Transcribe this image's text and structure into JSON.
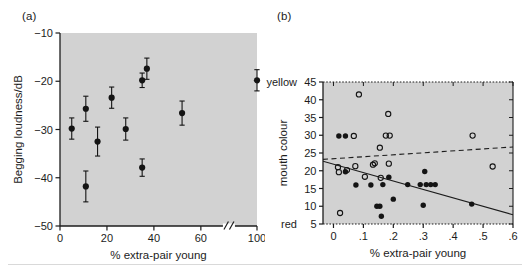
{
  "figure": {
    "background": "#ffffff",
    "plot_background": "#d2d2d2",
    "marker_color": "#141414",
    "panels": [
      "a",
      "b"
    ]
  },
  "panel_a": {
    "label": "(a)",
    "chart_data": {
      "type": "scatter",
      "title": "",
      "xlabel": "% extra-pair young",
      "ylabel": "Begging loudness/dB",
      "xlim": [
        0,
        100
      ],
      "ylim": [
        -50,
        -10
      ],
      "xticks": [
        0,
        20,
        40,
        60,
        100
      ],
      "xticklabels": [
        "0",
        "20",
        "40",
        "60",
        "100"
      ],
      "yticks": [
        -10,
        -20,
        -30,
        -40,
        -50
      ],
      "yticklabels": [
        "-10",
        "-20",
        "-30",
        "-40",
        "-50"
      ],
      "axis_break": {
        "present": true,
        "between": [
          60,
          100
        ],
        "symbol": "//"
      },
      "grid": false,
      "legend": "none",
      "error_bars": "vertical, symmetric (SE)",
      "points": [
        {
          "x": 5,
          "y": -29.8,
          "err": 2.2
        },
        {
          "x": 11,
          "y": -41.8,
          "err": 3.2
        },
        {
          "x": 11,
          "y": -25.7,
          "err": 2.6
        },
        {
          "x": 16,
          "y": -32.5,
          "err": 3.0
        },
        {
          "x": 22,
          "y": -23.4,
          "err": 2.2
        },
        {
          "x": 28,
          "y": -29.9,
          "err": 2.3
        },
        {
          "x": 35,
          "y": -37.9,
          "err": 1.8
        },
        {
          "x": 35,
          "y": -19.8,
          "err": 1.5
        },
        {
          "x": 37,
          "y": -17.4,
          "err": 2.2
        },
        {
          "x": 52,
          "y": -26.6,
          "err": 2.5
        },
        {
          "x": 100,
          "y": -19.8,
          "err": 2.2
        }
      ]
    }
  },
  "panel_b": {
    "label": "(b)",
    "chart_data": {
      "type": "scatter",
      "title": "",
      "xlabel": "% extra-pair young",
      "ylabel": "mouth colour",
      "ylabel_high": "yellow",
      "ylabel_low": "red",
      "xlim": [
        -0.035,
        0.6
      ],
      "ylim": [
        5,
        45
      ],
      "xticks": [
        0,
        0.1,
        0.2,
        0.3,
        0.4,
        0.5,
        0.6
      ],
      "xticklabels": [
        "0",
        ".1",
        ".2",
        ".3",
        ".4",
        ".5",
        ".6"
      ],
      "yticks": [
        5,
        10,
        15,
        20,
        25,
        30,
        35,
        40,
        45
      ],
      "yticklabels": [
        "5",
        "10",
        "15",
        "20",
        "25",
        "30",
        "35",
        "40",
        "45"
      ],
      "grid": false,
      "legend": "none",
      "series": [
        {
          "name": "open-circles",
          "marker": "open",
          "points": [
            {
              "x": 0.015,
              "y": 21.0
            },
            {
              "x": 0.018,
              "y": 19.6
            },
            {
              "x": 0.022,
              "y": 8.1
            },
            {
              "x": 0.045,
              "y": 20.2
            },
            {
              "x": 0.068,
              "y": 29.8
            },
            {
              "x": 0.073,
              "y": 21.3
            },
            {
              "x": 0.085,
              "y": 41.5
            },
            {
              "x": 0.105,
              "y": 18.3
            },
            {
              "x": 0.132,
              "y": 21.7
            },
            {
              "x": 0.138,
              "y": 22.1
            },
            {
              "x": 0.155,
              "y": 26.5
            },
            {
              "x": 0.158,
              "y": 18.0
            },
            {
              "x": 0.175,
              "y": 29.9
            },
            {
              "x": 0.188,
              "y": 29.9
            },
            {
              "x": 0.183,
              "y": 36.0
            },
            {
              "x": 0.185,
              "y": 22.0
            },
            {
              "x": 0.465,
              "y": 29.9
            },
            {
              "x": 0.532,
              "y": 21.2
            }
          ]
        },
        {
          "name": "filled-circles",
          "marker": "filled",
          "points": [
            {
              "x": 0.04,
              "y": 19.7
            },
            {
              "x": 0.018,
              "y": 29.8
            },
            {
              "x": 0.04,
              "y": 29.8
            },
            {
              "x": 0.075,
              "y": 16.0
            },
            {
              "x": 0.125,
              "y": 16.0
            },
            {
              "x": 0.145,
              "y": 10.0
            },
            {
              "x": 0.155,
              "y": 10.0
            },
            {
              "x": 0.16,
              "y": 7.2
            },
            {
              "x": 0.165,
              "y": 16.1
            },
            {
              "x": 0.185,
              "y": 18.2
            },
            {
              "x": 0.2,
              "y": 12.0
            },
            {
              "x": 0.248,
              "y": 16.1
            },
            {
              "x": 0.29,
              "y": 16.1
            },
            {
              "x": 0.3,
              "y": 10.3
            },
            {
              "x": 0.305,
              "y": 19.8
            },
            {
              "x": 0.31,
              "y": 16.1
            },
            {
              "x": 0.325,
              "y": 16.1
            },
            {
              "x": 0.34,
              "y": 16.1
            },
            {
              "x": 0.462,
              "y": 10.6
            }
          ]
        }
      ],
      "lines": [
        {
          "name": "solid-regression",
          "style": "solid",
          "x0": -0.035,
          "y0": 22.7,
          "x1": 0.6,
          "y1": 7.6
        },
        {
          "name": "dashed-regression",
          "style": "dashed",
          "x0": -0.035,
          "y0": 23.2,
          "x1": 0.6,
          "y1": 26.7
        }
      ]
    }
  }
}
